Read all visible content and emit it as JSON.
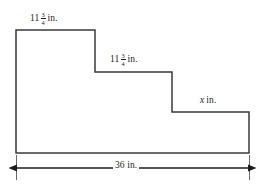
{
  "figure": {
    "shape_name": "staircase-polygon",
    "stroke_color": "#3a3a3a",
    "fill_color": "#ffffff",
    "text_color": "#1d1d1d",
    "labels": {
      "top_step_1": {
        "name": "top-edge-length",
        "whole": "11",
        "numerator": "3",
        "denominator": "4",
        "unit": "in."
      },
      "top_step_2": {
        "name": "second-step-length",
        "whole": "11",
        "numerator": "3",
        "denominator": "4",
        "unit": "in."
      },
      "top_step_3": {
        "name": "third-step-unknown-length",
        "variable": "x",
        "unit": "in."
      },
      "bottom_dimension": {
        "name": "overall-width",
        "value": "36",
        "unit": "in.",
        "full_text": "36 in."
      }
    },
    "geometry": {
      "vertices": "16,30 95,30 95,72 172,72 172,112 249,112 249,153 16,153",
      "dimension_line_y": 168,
      "dimension_line_x1": 16,
      "dimension_line_x2": 249,
      "extension_tick_left_x": 16,
      "extension_tick_right_x": 249,
      "extension_tick_top": 155,
      "extension_tick_bottom": 180
    }
  }
}
